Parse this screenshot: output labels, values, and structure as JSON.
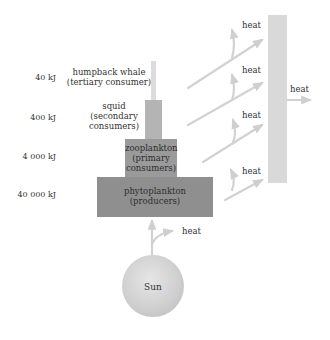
{
  "diagram": {
    "type": "energy-pyramid",
    "colors": {
      "whale": "#dcdcdc",
      "squid": "#b4b4b4",
      "zooplankton": "#9a9a9a",
      "phytoplankton": "#8f8f8f",
      "heat_sink": "#d9d9d9",
      "arrow": "#cfcfcf",
      "sun": "#cccccc"
    },
    "levels": [
      {
        "energy": "40 kJ",
        "name": "humpback whale",
        "role": "(tertiary consumer)"
      },
      {
        "energy": "400 kJ",
        "name": "squid",
        "role_line1": "(secondary",
        "role_line2": "consumers)"
      },
      {
        "energy": "4 000 kJ",
        "name": "zooplankton",
        "role_line1": "(primary",
        "role_line2": "consumers)"
      },
      {
        "energy": "40 000 kJ",
        "name": "phytoplankton",
        "role": "(producers)"
      }
    ],
    "heat_labels": [
      "heat",
      "heat",
      "heat",
      "heat",
      "heat",
      "heat"
    ],
    "source": {
      "name": "Sun"
    }
  }
}
